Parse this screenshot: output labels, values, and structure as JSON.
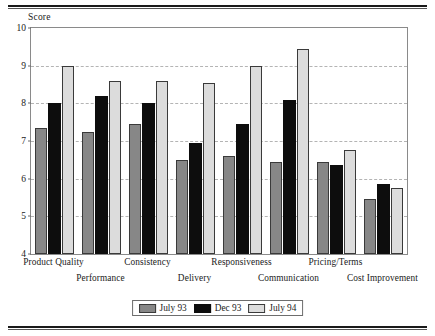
{
  "chart_data": {
    "type": "bar",
    "title": "",
    "subtitle": "",
    "xlabel": "",
    "ylabel": "Score",
    "ylim": [
      4,
      10
    ],
    "yticks": [
      4,
      5,
      6,
      7,
      8,
      9,
      10
    ],
    "grid": true,
    "legend_position": "bottom",
    "categories": [
      "Product Quality",
      "Performance",
      "Consistency",
      "Delivery",
      "Responsiveness",
      "Communication",
      "Pricing/Terms",
      "Cost Improvement"
    ],
    "series": [
      {
        "name": "July 93",
        "color": "#878787",
        "values": [
          7.35,
          7.25,
          7.45,
          6.5,
          6.6,
          6.45,
          6.45,
          5.45
        ]
      },
      {
        "name": "Dec 93",
        "color": "#0d0d0d",
        "values": [
          8.0,
          8.2,
          8.0,
          6.95,
          7.45,
          8.1,
          6.35,
          5.85
        ]
      },
      {
        "name": "July 94",
        "color": "#dcdcdc",
        "values": [
          9.0,
          8.6,
          8.6,
          8.55,
          9.0,
          9.45,
          6.75,
          5.75
        ]
      }
    ]
  },
  "axis": {
    "y_title": "Score"
  },
  "legend": {
    "items": [
      {
        "label": "July 93",
        "series": 0
      },
      {
        "label": "Dec 93",
        "series": 1
      },
      {
        "label": "July 94",
        "series": 2
      }
    ]
  }
}
